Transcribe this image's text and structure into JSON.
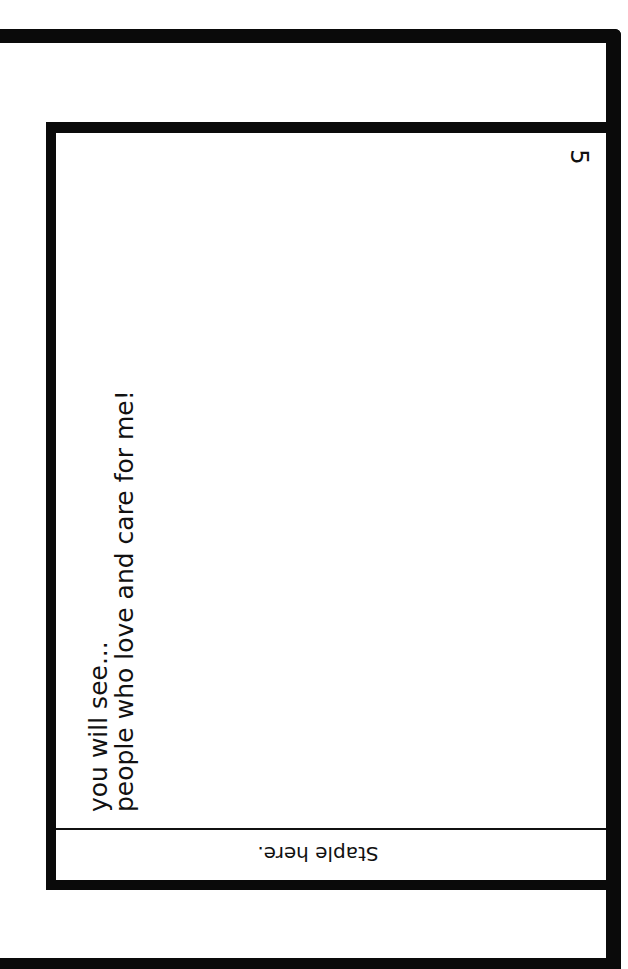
{
  "page": {
    "number": "5",
    "verse_line_1": "you will see...",
    "verse_line_2": "people who love and care for me!",
    "staple_label": "Staple here."
  },
  "colors": {
    "border": "#0a0a0a",
    "background": "#ffffff",
    "text": "#111111"
  }
}
